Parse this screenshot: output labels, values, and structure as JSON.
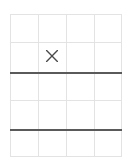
{
  "figure": {
    "kind": "grid-worksheet",
    "background_color": "#ffffff",
    "width": 131,
    "height": 165
  },
  "grid": {
    "columns": 4,
    "rows": 5,
    "left": 10,
    "top": 14,
    "width": 112,
    "height": 143,
    "thin_line_color": "#e3e3e3",
    "thick_line_color": "#5a5a5a",
    "vertical_positions": [
      0,
      28,
      56,
      84,
      112
    ],
    "horizontal_positions": [
      0,
      28,
      58,
      86,
      115,
      143
    ],
    "thick_horizontal_indices": [
      2,
      4
    ]
  },
  "marks": [
    {
      "glyph": "×",
      "label": "x-mark",
      "row": 2,
      "column": 2,
      "center_x": 50,
      "center_y": 56,
      "color": "#4a4a4a",
      "size": 16
    }
  ],
  "horizontal_lines": [
    {
      "name": "grid-line-h-0",
      "y": 0,
      "weight": "thin"
    },
    {
      "name": "grid-line-h-1",
      "y": 28,
      "weight": "thin"
    },
    {
      "name": "grid-line-h-2",
      "y": 58,
      "weight": "thick"
    },
    {
      "name": "grid-line-h-3",
      "y": 86,
      "weight": "thin"
    },
    {
      "name": "grid-line-h-4",
      "y": 115,
      "weight": "thick"
    },
    {
      "name": "grid-line-h-5",
      "y": 143,
      "weight": "thin"
    }
  ],
  "vertical_lines": [
    {
      "name": "grid-line-v-0",
      "x": 0,
      "weight": "thin"
    },
    {
      "name": "grid-line-v-1",
      "x": 28,
      "weight": "thin"
    },
    {
      "name": "grid-line-v-2",
      "x": 56,
      "weight": "thin"
    },
    {
      "name": "grid-line-v-3",
      "x": 84,
      "weight": "thin"
    },
    {
      "name": "grid-line-v-4",
      "x": 112,
      "weight": "thin"
    }
  ]
}
